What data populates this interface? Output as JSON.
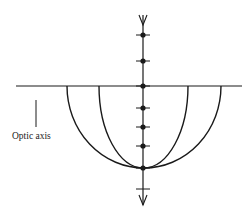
{
  "diagram": {
    "title": "",
    "labels": {
      "optic_axis": "Optic axis"
    },
    "geometry": {
      "center_x": 143,
      "surface_y": 86,
      "surface_x_start": 16,
      "surface_x_end": 242,
      "bottom_y": 168,
      "arcs": [
        {
          "name": "outer-wavefront",
          "left_x": 67,
          "right_x": 221
        },
        {
          "name": "inner-wavefront",
          "left_x": 99,
          "right_x": 188
        }
      ],
      "axis_top_y": 15,
      "axis_bottom_y": 205,
      "dots_y": [
        35,
        61,
        86,
        108,
        127,
        146,
        168
      ],
      "ticks_y": [
        35,
        61,
        86,
        108,
        127,
        146,
        168,
        189
      ],
      "optic_axis_marker": {
        "x": 36,
        "y1": 100,
        "y2": 127
      }
    },
    "colors": {
      "ink": "#1a1a1a",
      "background": "#ffffff"
    }
  }
}
